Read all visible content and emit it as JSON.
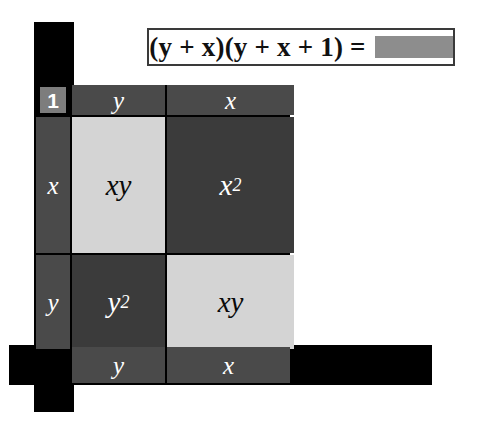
{
  "equation": {
    "expression": "(y + x)(y + x + 1) =",
    "answer_blank": "",
    "answer_blank_state": "redacted"
  },
  "grid": {
    "corner_label": "1",
    "column_headers": [
      "y",
      "x"
    ],
    "row_headers": [
      "x",
      "y"
    ],
    "cells": [
      [
        {
          "label": "xy",
          "base": "xy",
          "exponent": "",
          "tone": "light"
        },
        {
          "label": "x2",
          "base": "x",
          "exponent": "2",
          "tone": "dark"
        }
      ],
      [
        {
          "label": "y2",
          "base": "y",
          "exponent": "2",
          "tone": "dark"
        },
        {
          "label": "xy",
          "base": "xy",
          "exponent": "",
          "tone": "light"
        }
      ]
    ]
  },
  "bottom_labels": [
    "y",
    "x"
  ],
  "colors": {
    "rule_black": "#000000",
    "header_gray": "#4a4a4a",
    "cell_light": "#d4d4d4",
    "cell_dark": "#3b3b3b",
    "blank_gray": "#8d8d8d",
    "corner_chip": "#7d7d7d",
    "page_background": "#ffffff"
  }
}
